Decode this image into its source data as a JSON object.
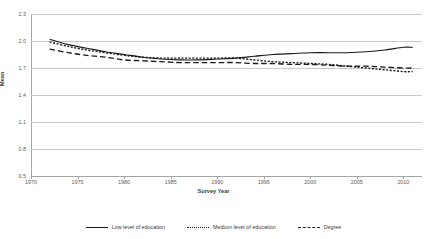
{
  "chart_data": {
    "type": "line",
    "title": "",
    "xlabel": "Survey Year",
    "ylabel": "Mean",
    "xlim": [
      1970,
      2012
    ],
    "ylim": [
      0.5,
      2.3
    ],
    "grid": "horizontal",
    "legend_position": "bottom",
    "xticks": [
      1970,
      1975,
      1980,
      1985,
      1990,
      1995,
      2000,
      2005,
      2010
    ],
    "yticks": [
      0.5,
      0.8,
      1.1,
      1.4,
      1.7,
      2.0,
      2.3
    ],
    "x": [
      1972,
      1974,
      1976,
      1978,
      1980,
      1982,
      1984,
      1986,
      1988,
      1990,
      1992,
      1994,
      1996,
      1998,
      2000,
      2002,
      2004,
      2006,
      2008,
      2010,
      2011
    ],
    "series": [
      {
        "name": "Low level of education",
        "style": "solid",
        "values": [
          2.02,
          1.96,
          1.92,
          1.88,
          1.85,
          1.82,
          1.8,
          1.79,
          1.79,
          1.8,
          1.81,
          1.83,
          1.85,
          1.86,
          1.87,
          1.87,
          1.87,
          1.88,
          1.9,
          1.93,
          1.93
        ]
      },
      {
        "name": "Medium level of education",
        "style": "dotted",
        "values": [
          1.99,
          1.94,
          1.9,
          1.87,
          1.84,
          1.82,
          1.81,
          1.81,
          1.81,
          1.81,
          1.81,
          1.79,
          1.77,
          1.76,
          1.75,
          1.74,
          1.72,
          1.7,
          1.68,
          1.66,
          1.66
        ]
      },
      {
        "name": "Degree",
        "style": "dashed",
        "values": [
          1.91,
          1.87,
          1.84,
          1.82,
          1.79,
          1.78,
          1.77,
          1.76,
          1.76,
          1.76,
          1.76,
          1.75,
          1.75,
          1.74,
          1.74,
          1.73,
          1.72,
          1.72,
          1.71,
          1.7,
          1.7
        ]
      }
    ]
  },
  "axis": {
    "y_title": "Mean",
    "x_title": "Survey Year"
  },
  "legend": {
    "items": [
      {
        "label": "Low level of education"
      },
      {
        "label": "Medium level of education"
      },
      {
        "label": "Degree"
      }
    ]
  }
}
